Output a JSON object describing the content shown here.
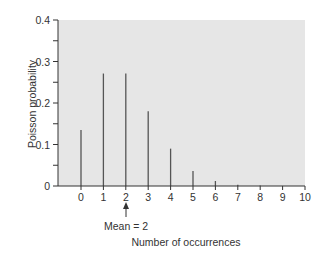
{
  "chart_data": {
    "type": "bar",
    "title": "",
    "xlabel": "Number of occurrences",
    "ylabel": "Poisson probability",
    "categories": [
      "0",
      "1",
      "2",
      "3",
      "4",
      "5",
      "6",
      "7",
      "8",
      "9",
      "10"
    ],
    "values": [
      0.135,
      0.271,
      0.271,
      0.18,
      0.09,
      0.036,
      0.012,
      0.003,
      0.001,
      0.0002,
      0.0
    ],
    "ylim": [
      0,
      0.4
    ],
    "xlim": [
      -1,
      10
    ],
    "yticks": [
      "0",
      "0.1",
      "0.2",
      "0.3",
      "0.4"
    ],
    "xticks": [
      "0",
      "1",
      "2",
      "3",
      "4",
      "5",
      "6",
      "7",
      "8",
      "9",
      "10"
    ],
    "annotation": {
      "text": "Mean = 2",
      "x": 2
    },
    "grid": false,
    "legend": null,
    "colors": {
      "plot_background": "#e6e6e6",
      "bars": "#555555",
      "axes": "#333333"
    }
  },
  "labels": {
    "ylabel": "Poisson probability",
    "xlabel": "Number of occurrences",
    "annotation": "Mean = 2"
  }
}
